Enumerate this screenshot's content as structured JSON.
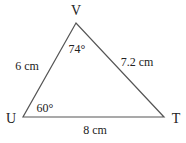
{
  "diagram": {
    "type": "triangle",
    "vertices": {
      "V": {
        "label": "V",
        "x": 76,
        "y": 23
      },
      "U": {
        "label": "U",
        "x": 23,
        "y": 117
      },
      "T": {
        "label": "T",
        "x": 164,
        "y": 117
      }
    },
    "sides": {
      "UV": {
        "label": "6 cm"
      },
      "VT": {
        "label": "7.2 cm"
      },
      "UT": {
        "label": "8 cm"
      }
    },
    "angles": {
      "V": {
        "label": "74°"
      },
      "U": {
        "label": "60°"
      }
    },
    "stroke_color": "#555555"
  }
}
